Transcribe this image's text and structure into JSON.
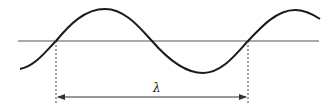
{
  "diagram": {
    "type": "wave-wavelength",
    "label": "λ",
    "colors": {
      "wave": "#1a1a1a",
      "axis": "#555555",
      "guides": "#444444"
    },
    "elements": [
      "sine wave curve",
      "horizontal equilibrium axis",
      "two dotted vertical guide lines at one wavelength apart",
      "double-headed arrow between guides",
      "wavelength label λ"
    ]
  }
}
